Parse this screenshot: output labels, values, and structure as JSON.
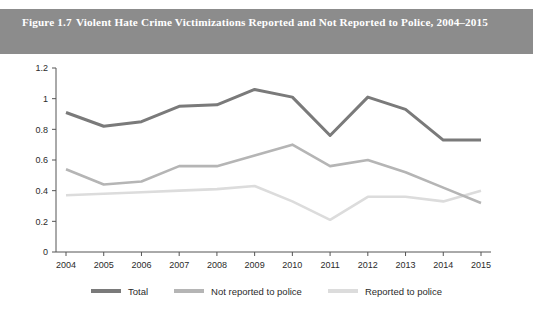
{
  "figure": {
    "number": "Figure 1.7",
    "title": "Violent Hate Crime Victimizations Reported and Not Reported to Police, 2004–2015",
    "header_bg": "#8c8c8c",
    "header_text_color": "#ffffff"
  },
  "chart_data": {
    "type": "line",
    "title": "Violent Hate Crime Victimizations Reported and Not Reported to Police, 2004–2015",
    "xlabel": "",
    "ylabel": "",
    "categories": [
      "2004",
      "2005",
      "2006",
      "2007",
      "2008",
      "2009",
      "2010",
      "2011",
      "2012",
      "2013",
      "2014",
      "2015"
    ],
    "x": [
      2004,
      2005,
      2006,
      2007,
      2008,
      2009,
      2010,
      2011,
      2012,
      2013,
      2014,
      2015
    ],
    "ylim": [
      0,
      1.2
    ],
    "yticks": [
      "0",
      "0.2",
      "0.4",
      "0.6",
      "0.8",
      "1",
      "1.2"
    ],
    "ytick_values": [
      0,
      0.2,
      0.4,
      0.6,
      0.8,
      1,
      1.2
    ],
    "grid": false,
    "legend_position": "bottom",
    "series": [
      {
        "name": "Total",
        "color": "#7a7a7a",
        "width": 3.0,
        "values": [
          0.91,
          0.82,
          0.85,
          0.95,
          0.96,
          1.06,
          1.01,
          0.76,
          1.01,
          0.93,
          0.73,
          0.73
        ]
      },
      {
        "name": "Not reported to police",
        "color": "#b5b5b5",
        "width": 2.6,
        "values": [
          0.54,
          0.44,
          0.46,
          0.56,
          0.56,
          0.63,
          0.7,
          0.56,
          0.6,
          0.52,
          0.42,
          0.32
        ]
      },
      {
        "name": "Reported to police",
        "color": "#dcdcdc",
        "width": 2.6,
        "values": [
          0.37,
          0.38,
          0.39,
          0.4,
          0.41,
          0.43,
          0.33,
          0.21,
          0.36,
          0.36,
          0.33,
          0.4
        ]
      }
    ]
  },
  "axis": {
    "line_color": "#555555",
    "tick_color": "#555555"
  }
}
